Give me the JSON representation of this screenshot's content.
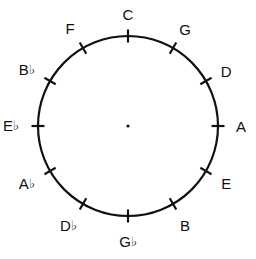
{
  "diagram": {
    "background_color": "#ffffff",
    "stroke_color": "#111111",
    "center": {
      "x": 128,
      "y": 126
    },
    "radius": 90,
    "tick_length": 13,
    "center_dot_radius": 1.6,
    "notes": [
      {
        "name": "C",
        "letter": "C",
        "accidental": "",
        "angle_deg": 0,
        "label_offset": 20,
        "label_dx": 0,
        "label_dy": -2
      },
      {
        "name": "G",
        "letter": "G",
        "accidental": "",
        "angle_deg": 30,
        "label_offset": 20,
        "label_dx": 2,
        "label_dy": -2
      },
      {
        "name": "D",
        "letter": "D",
        "accidental": "",
        "angle_deg": 60,
        "label_offset": 20,
        "label_dx": 3,
        "label_dy": 0
      },
      {
        "name": "A",
        "letter": "A",
        "accidental": "",
        "angle_deg": 90,
        "label_offset": 20,
        "label_dx": 3,
        "label_dy": 0
      },
      {
        "name": "E",
        "letter": "E",
        "accidental": "",
        "angle_deg": 120,
        "label_offset": 20,
        "label_dx": 3,
        "label_dy": 2
      },
      {
        "name": "B",
        "letter": "B",
        "accidental": "",
        "angle_deg": 150,
        "label_offset": 20,
        "label_dx": 2,
        "label_dy": 4
      },
      {
        "name": "Gb",
        "letter": "G",
        "accidental": "♭",
        "angle_deg": 180,
        "label_offset": 21,
        "label_dx": 0,
        "label_dy": 5
      },
      {
        "name": "Db",
        "letter": "D",
        "accidental": "♭",
        "angle_deg": 210,
        "label_offset": 21,
        "label_dx": -4,
        "label_dy": 4
      },
      {
        "name": "Ab",
        "letter": "A",
        "accidental": "♭",
        "angle_deg": 240,
        "label_offset": 21,
        "label_dx": -5,
        "label_dy": 2
      },
      {
        "name": "Eb",
        "letter": "E",
        "accidental": "♭",
        "angle_deg": 270,
        "label_offset": 22,
        "label_dx": -5,
        "label_dy": 0
      },
      {
        "name": "Bb",
        "letter": "B",
        "accidental": "♭",
        "angle_deg": 300,
        "label_offset": 21,
        "label_dx": -5,
        "label_dy": -1
      },
      {
        "name": "F",
        "letter": "F",
        "accidental": "",
        "angle_deg": 330,
        "label_offset": 20,
        "label_dx": -3,
        "label_dy": -3
      }
    ]
  }
}
